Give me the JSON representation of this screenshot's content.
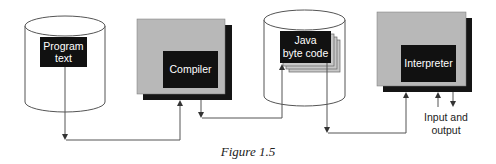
{
  "figure": {
    "caption": "Figure 1.5"
  },
  "nodes": {
    "program_text": {
      "label_line1": "Program",
      "label_line2": "text",
      "shape": "cylinder"
    },
    "compiler": {
      "label": "Compiler",
      "shape": "shadowed-box"
    },
    "java_byte_code": {
      "label_line1": "Java",
      "label_line2": "byte code",
      "shape": "cylinder-with-stacked-pages"
    },
    "interpreter": {
      "label": "Interpreter",
      "shape": "shadowed-box"
    }
  },
  "io": {
    "label_line1": "Input and",
    "label_line2": "output"
  },
  "edges": [
    {
      "from": "program_text",
      "to": "compiler"
    },
    {
      "from": "compiler",
      "to": "java_byte_code"
    },
    {
      "from": "java_byte_code",
      "to": "interpreter"
    },
    {
      "from": "io",
      "to": "interpreter"
    },
    {
      "from": "interpreter",
      "to": "io"
    }
  ],
  "colors": {
    "box_fill": "#b8b8b8",
    "shadow": "#151515",
    "label_box": "#111111",
    "cylinder_fill": "#ffffff",
    "cylinder_stroke": "#555555",
    "page_fill": "#c8c8c8"
  }
}
